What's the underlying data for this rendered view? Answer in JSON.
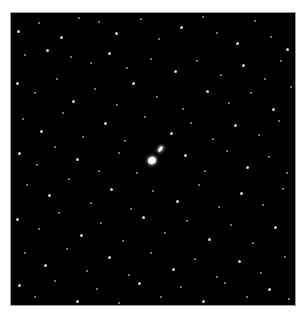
{
  "image": {
    "description": "Astronomical star field with a bright central galaxy pair",
    "frame": {
      "x": 10,
      "y": 12,
      "width": 286,
      "height": 294,
      "background": "#000000",
      "border": "#9a9a9a"
    }
  },
  "galaxies": [
    {
      "x": 141,
      "y": 147,
      "w": 8,
      "h": 7,
      "rot": -30
    },
    {
      "x": 149,
      "y": 136,
      "w": 3,
      "h": 6,
      "rot": 35
    }
  ],
  "stars": [
    [
      7,
      18,
      1.5
    ],
    [
      28,
      10,
      1
    ],
    [
      50,
      24,
      1.5
    ],
    [
      68,
      5,
      1
    ],
    [
      88,
      9,
      1
    ],
    [
      105,
      20,
      1.5
    ],
    [
      130,
      6,
      1
    ],
    [
      148,
      26,
      1
    ],
    [
      170,
      14,
      1.5
    ],
    [
      192,
      4,
      1
    ],
    [
      206,
      20,
      1
    ],
    [
      226,
      30,
      1.5
    ],
    [
      244,
      8,
      1
    ],
    [
      260,
      24,
      1
    ],
    [
      276,
      36,
      1.5
    ],
    [
      14,
      42,
      1
    ],
    [
      36,
      37,
      1.5
    ],
    [
      60,
      44,
      1
    ],
    [
      80,
      50,
      1
    ],
    [
      98,
      40,
      1.5
    ],
    [
      116,
      55,
      1
    ],
    [
      140,
      46,
      1
    ],
    [
      164,
      58,
      1.5
    ],
    [
      186,
      48,
      1
    ],
    [
      210,
      62,
      1
    ],
    [
      232,
      52,
      1.5
    ],
    [
      254,
      66,
      1
    ],
    [
      270,
      48,
      1
    ],
    [
      6,
      70,
      1.5
    ],
    [
      24,
      80,
      1
    ],
    [
      46,
      66,
      1
    ],
    [
      62,
      88,
      1.5
    ],
    [
      84,
      76,
      1
    ],
    [
      106,
      92,
      1
    ],
    [
      122,
      70,
      1.5
    ],
    [
      146,
      84,
      1
    ],
    [
      172,
      96,
      1
    ],
    [
      196,
      78,
      1.5
    ],
    [
      218,
      90,
      1
    ],
    [
      240,
      80,
      1
    ],
    [
      262,
      96,
      1.5
    ],
    [
      280,
      74,
      1
    ],
    [
      12,
      106,
      1
    ],
    [
      30,
      118,
      1.5
    ],
    [
      52,
      100,
      1
    ],
    [
      72,
      124,
      1
    ],
    [
      94,
      110,
      1.5
    ],
    [
      114,
      128,
      1
    ],
    [
      134,
      104,
      1
    ],
    [
      160,
      120,
      1.5
    ],
    [
      180,
      110,
      1
    ],
    [
      202,
      126,
      1
    ],
    [
      224,
      112,
      1.5
    ],
    [
      248,
      122,
      1
    ],
    [
      268,
      108,
      1
    ],
    [
      8,
      140,
      1.5
    ],
    [
      26,
      152,
      1
    ],
    [
      44,
      134,
      1
    ],
    [
      66,
      146,
      1.5
    ],
    [
      88,
      158,
      1
    ],
    [
      108,
      140,
      1
    ],
    [
      126,
      160,
      1
    ],
    [
      174,
      142,
      1.5
    ],
    [
      194,
      158,
      1
    ],
    [
      216,
      138,
      1
    ],
    [
      236,
      154,
      1.5
    ],
    [
      258,
      144,
      1
    ],
    [
      276,
      160,
      1
    ],
    [
      16,
      172,
      1
    ],
    [
      38,
      182,
      1.5
    ],
    [
      58,
      166,
      1
    ],
    [
      80,
      190,
      1
    ],
    [
      100,
      176,
      1.5
    ],
    [
      120,
      196,
      1
    ],
    [
      142,
      178,
      1
    ],
    [
      166,
      188,
      1.5
    ],
    [
      188,
      172,
      1
    ],
    [
      208,
      194,
      1
    ],
    [
      230,
      180,
      1.5
    ],
    [
      252,
      192,
      1
    ],
    [
      272,
      176,
      1
    ],
    [
      6,
      206,
      1.5
    ],
    [
      28,
      216,
      1
    ],
    [
      48,
      200,
      1
    ],
    [
      70,
      222,
      1.5
    ],
    [
      90,
      210,
      1
    ],
    [
      112,
      228,
      1
    ],
    [
      132,
      204,
      1.5
    ],
    [
      154,
      220,
      1
    ],
    [
      176,
      208,
      1
    ],
    [
      198,
      226,
      1.5
    ],
    [
      220,
      212,
      1
    ],
    [
      242,
      230,
      1
    ],
    [
      264,
      214,
      1.5
    ],
    [
      14,
      240,
      1
    ],
    [
      34,
      252,
      1.5
    ],
    [
      56,
      236,
      1
    ],
    [
      76,
      258,
      1
    ],
    [
      98,
      244,
      1.5
    ],
    [
      118,
      262,
      1
    ],
    [
      140,
      240,
      1
    ],
    [
      162,
      256,
      1.5
    ],
    [
      184,
      246,
      1
    ],
    [
      206,
      264,
      1
    ],
    [
      228,
      248,
      1.5
    ],
    [
      250,
      260,
      1
    ],
    [
      274,
      244,
      1
    ],
    [
      8,
      272,
      1.5
    ],
    [
      24,
      284,
      1
    ],
    [
      44,
      268,
      1
    ],
    [
      66,
      288,
      1.5
    ],
    [
      86,
      276,
      1
    ],
    [
      108,
      290,
      1
    ],
    [
      128,
      270,
      1.5
    ],
    [
      150,
      284,
      1
    ],
    [
      170,
      274,
      1
    ],
    [
      192,
      288,
      1.5
    ],
    [
      214,
      270,
      1
    ],
    [
      236,
      284,
      1
    ],
    [
      258,
      276,
      1.5
    ],
    [
      278,
      286,
      1
    ]
  ]
}
